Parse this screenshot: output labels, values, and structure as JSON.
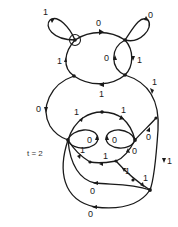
{
  "diagram": {
    "time_label": "t = 2",
    "colors": {
      "stroke": "#1a1a1a",
      "background": "#ffffff"
    },
    "edge_labels": {
      "top_left_loop": "1",
      "top_arc": "0",
      "top_right_loop": "0",
      "left_arc_upper": "1",
      "inner_lens_left": "0",
      "inner_lens_right": "1",
      "bottom_arc_upper": "1",
      "right_outer_upper": "1",
      "left_outer": "0",
      "mid_arc_left": "1",
      "mid_arc_right": "1",
      "inner_loop_left": "0",
      "inner_loop_right": "0",
      "right_inner": "0",
      "lower_chain_1": "1",
      "lower_chain_2": "1",
      "lower_chain_3": "0",
      "diag_1": "1",
      "diag_2": "1",
      "right_outer_lower": "1",
      "lower_arc": "0",
      "bottom_arc": "0"
    }
  }
}
